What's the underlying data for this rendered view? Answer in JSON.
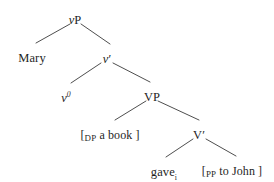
{
  "figure": {
    "name": "vp-shell-syntax-tree",
    "background_color": "#ffffff",
    "line_color": "#3a3a3a",
    "text_color": "#1f1f1f"
  },
  "nodes": {
    "vp": {
      "label": "vP",
      "head": "v",
      "projection": "P",
      "x": 75,
      "y": 14
    },
    "mary": {
      "label": "Mary",
      "x": 32,
      "y": 52
    },
    "vbar": {
      "label": "v′",
      "head": "v",
      "projection": "′",
      "x": 107,
      "y": 53
    },
    "v0": {
      "label": "v⁰",
      "head": "v",
      "projection": "0",
      "x": 66,
      "y": 92
    },
    "vp_big": {
      "label": "VP",
      "x": 152,
      "y": 91
    },
    "dp": {
      "open_bracket": "[",
      "category": "DP",
      "text": " a book ",
      "close_bracket": "]",
      "full_label": "[DP a book ]",
      "x": 110,
      "y": 129
    },
    "vbar_big": {
      "label": "V′",
      "head": "V",
      "projection": "′",
      "x": 199,
      "y": 129
    },
    "gave": {
      "text": "gave",
      "index": "i",
      "full_label": "gavei",
      "x": 164,
      "y": 166
    },
    "pp": {
      "open_bracket": "[",
      "category": "PP",
      "text": " to John ",
      "close_bracket": "]",
      "full_label": "[PP to John ]",
      "x": 232,
      "y": 165
    }
  },
  "branches": [
    {
      "name": "vp-to-mary",
      "x1": 70,
      "y1": 24,
      "x2": 36,
      "y2": 43
    },
    {
      "name": "vp-to-vbar",
      "x1": 81,
      "y1": 24,
      "x2": 110,
      "y2": 44
    },
    {
      "name": "vbar-to-v0",
      "x1": 101,
      "y1": 63,
      "x2": 71,
      "y2": 83
    },
    {
      "name": "vbar-to-vp",
      "x1": 113,
      "y1": 63,
      "x2": 150,
      "y2": 82
    },
    {
      "name": "vp-to-dp",
      "x1": 146,
      "y1": 101,
      "x2": 115,
      "y2": 120
    },
    {
      "name": "vp-to-vbar-big",
      "x1": 158,
      "y1": 101,
      "x2": 199,
      "y2": 120
    },
    {
      "name": "vbar-big-to-gave",
      "x1": 193,
      "y1": 139,
      "x2": 166,
      "y2": 157
    },
    {
      "name": "vbar-big-to-pp",
      "x1": 206,
      "y1": 139,
      "x2": 236,
      "y2": 156
    }
  ]
}
